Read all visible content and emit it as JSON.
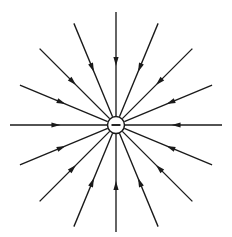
{
  "figure": {
    "title": "Electric field lines of a negative point charge",
    "type": "physics-field-diagram",
    "background_color": "#ffffff",
    "line_color": "#1a1a1a",
    "width": 232,
    "height": 237
  },
  "charge": {
    "sign": "−",
    "polarity": "negative",
    "center_x": 116,
    "center_y": 125,
    "radius": 8.5,
    "sign_half_width": 4.5,
    "fill_color": "#ffffff",
    "stroke_color": "#1a1a1a"
  },
  "field": {
    "direction": "inward",
    "line_count": 16,
    "angle_step_degrees": 22.5,
    "inner_radius": 9,
    "outer_radius": 108,
    "arrow_position_fraction": 0.52,
    "arrow_length": 9,
    "arrow_half_width": 2.6,
    "stroke_width": 1.35,
    "lines": [
      {
        "index": 0,
        "angle": 0,
        "label": "field-line-0deg",
        "outer_radius": 106
      },
      {
        "index": 1,
        "angle": 22.5,
        "label": "field-line-22deg",
        "outer_radius": 104
      },
      {
        "index": 2,
        "angle": 45,
        "label": "field-line-45deg",
        "outer_radius": 108
      },
      {
        "index": 3,
        "angle": 67.5,
        "label": "field-line-67deg",
        "outer_radius": 110
      },
      {
        "index": 4,
        "angle": 90,
        "label": "field-line-90deg",
        "outer_radius": 113
      },
      {
        "index": 5,
        "angle": 112.5,
        "label": "field-line-112deg",
        "outer_radius": 110
      },
      {
        "index": 6,
        "angle": 135,
        "label": "field-line-135deg",
        "outer_radius": 108
      },
      {
        "index": 7,
        "angle": 157.5,
        "label": "field-line-157deg",
        "outer_radius": 104
      },
      {
        "index": 8,
        "angle": 180,
        "label": "field-line-180deg",
        "outer_radius": 106
      },
      {
        "index": 9,
        "angle": 202.5,
        "label": "field-line-202deg",
        "outer_radius": 104
      },
      {
        "index": 10,
        "angle": 225,
        "label": "field-line-225deg",
        "outer_radius": 108
      },
      {
        "index": 11,
        "angle": 247.5,
        "label": "field-line-247deg",
        "outer_radius": 110
      },
      {
        "index": 12,
        "angle": 270,
        "label": "field-line-270deg",
        "outer_radius": 107
      },
      {
        "index": 13,
        "angle": 292.5,
        "label": "field-line-292deg",
        "outer_radius": 110
      },
      {
        "index": 14,
        "angle": 315,
        "label": "field-line-315deg",
        "outer_radius": 108
      },
      {
        "index": 15,
        "angle": 337.5,
        "label": "field-line-337deg",
        "outer_radius": 104
      }
    ]
  }
}
